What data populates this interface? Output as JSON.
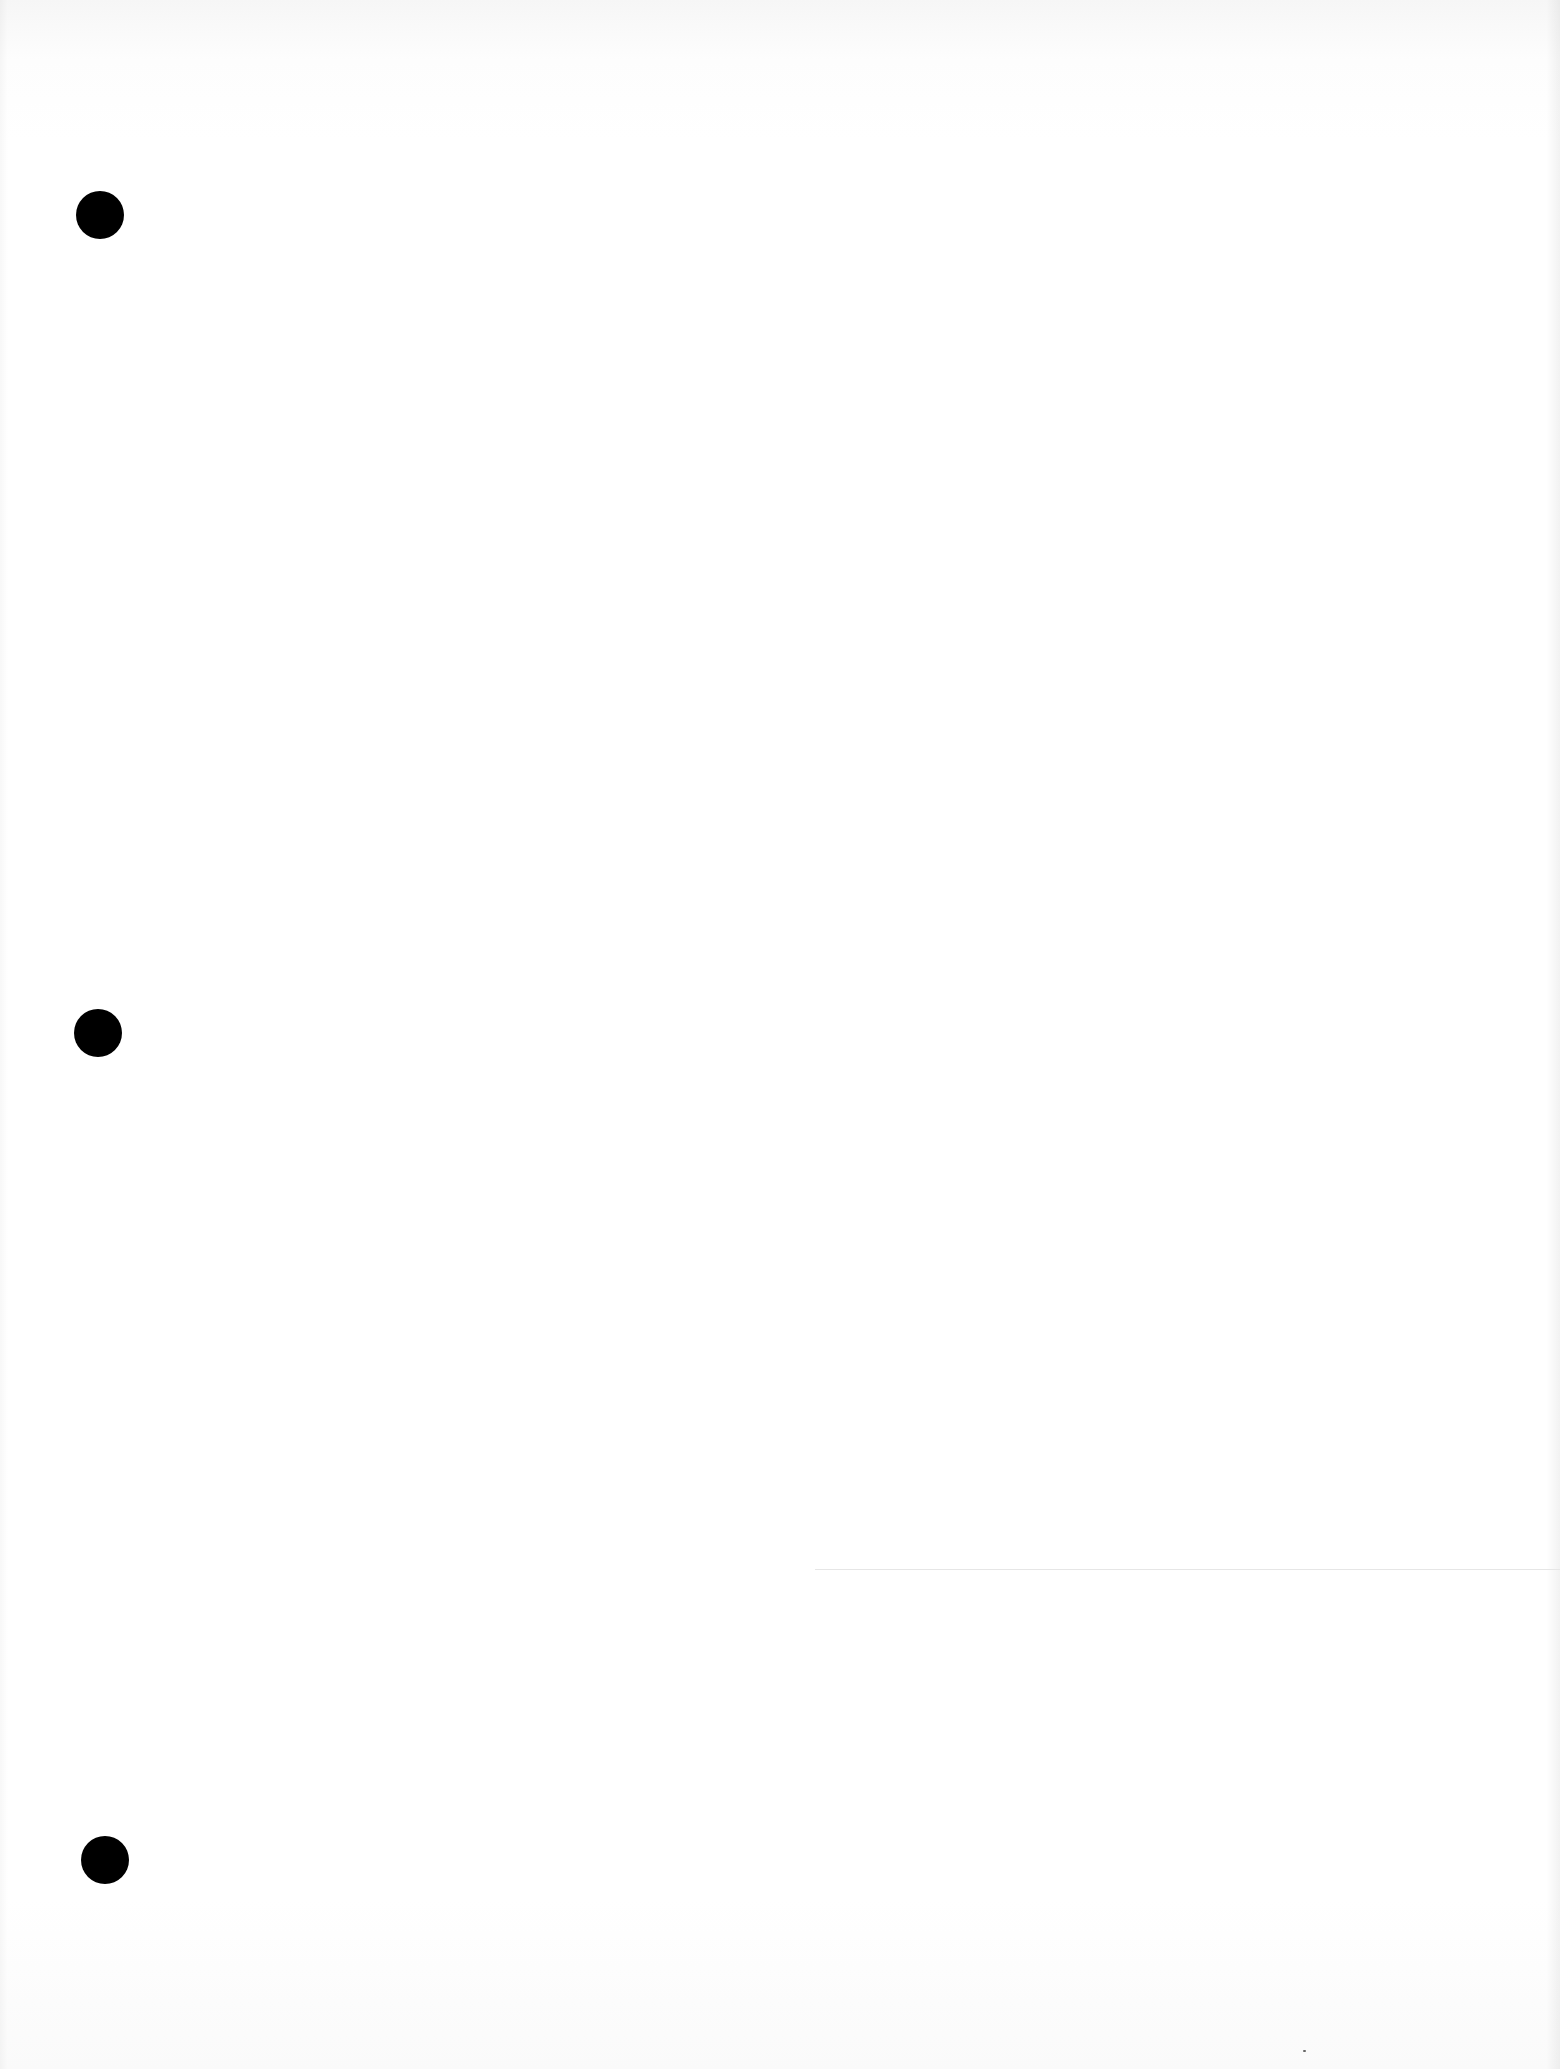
{
  "document": {
    "type": "blank scanned page",
    "background_color": "#ffffff",
    "text_content": ""
  },
  "punch_holes": [
    {
      "name": "top",
      "x": 100,
      "y": 215,
      "color": "#000000"
    },
    {
      "name": "middle",
      "x": 98,
      "y": 1033,
      "color": "#000000"
    },
    {
      "name": "bottom",
      "x": 105,
      "y": 1860,
      "color": "#000000"
    }
  ],
  "artifacts": {
    "faint_line": {
      "x1": 815,
      "x2": 1560,
      "y": 1569,
      "color": "#e6e6e6"
    },
    "speck": {
      "x": 1303,
      "y": 2050
    }
  }
}
